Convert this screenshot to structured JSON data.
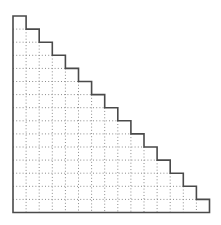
{
  "diagram": {
    "type": "staircase-grid",
    "steps": 15,
    "origin": {
      "x": 13,
      "y": 16
    },
    "step_size": 13.1,
    "outline_color": "#4a4a4a",
    "outline_width": 1.6,
    "grid_color": "#8c8c8c",
    "grid_dash": "1 2.2",
    "background": "#ffffff"
  }
}
